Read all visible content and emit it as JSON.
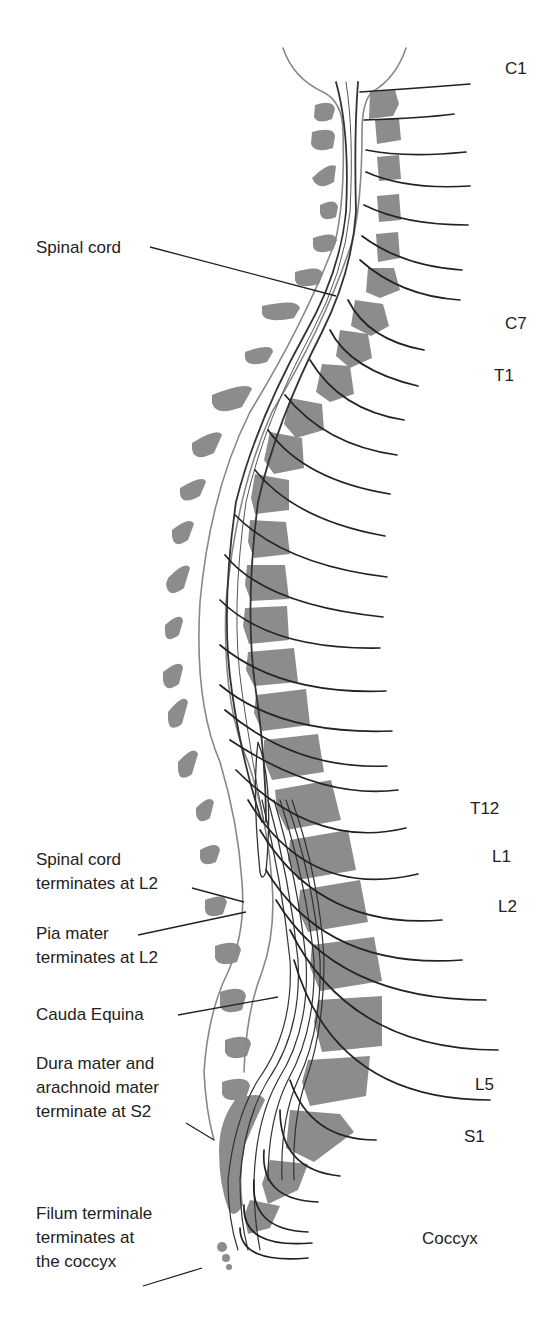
{
  "figure": {
    "type": "anatomical diagram",
    "colors": {
      "vertebra_fill": "#8c8c8c",
      "nerve_stroke": "#222222",
      "label_text": "#222222",
      "background": "#ffffff"
    }
  },
  "left_labels": [
    {
      "id": "spinal-cord",
      "lines": [
        "Spinal cord"
      ]
    },
    {
      "id": "cord-terminates",
      "lines": [
        "Spinal cord",
        "terminates at L2"
      ]
    },
    {
      "id": "pia-mater",
      "lines": [
        "Pia mater",
        "terminates at L2"
      ]
    },
    {
      "id": "cauda-equina",
      "lines": [
        "Cauda Equina"
      ]
    },
    {
      "id": "dura-mater",
      "lines": [
        "Dura mater and",
        "arachnoid mater",
        "terminate at S2"
      ]
    },
    {
      "id": "filum-terminale",
      "lines": [
        "Filum terminale",
        "terminates at",
        "the coccyx"
      ]
    }
  ],
  "right_labels": {
    "c1": "C1",
    "c7": "C7",
    "t1": "T1",
    "t12": "T12",
    "l1": "L1",
    "l2": "L2",
    "l5": "L5",
    "s1": "S1",
    "coccyx": "Coccyx"
  },
  "caption": {
    "text": "",
    "note_visible": "truncated italic caption line at bottom edge"
  }
}
